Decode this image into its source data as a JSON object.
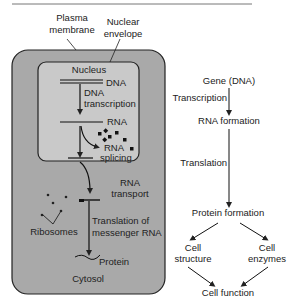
{
  "colors": {
    "cytosol_fill": "#a9a9a9",
    "nucleus_fill": "#c9c9c9",
    "outline": "#222222",
    "text": "#222222",
    "background": "#ffffff"
  },
  "left_panel": {
    "labels": {
      "plasma_membrane_1": "Plasma",
      "plasma_membrane_2": "membrane",
      "nuclear_envelope_1": "Nuclear",
      "nuclear_envelope_2": "envelope",
      "nucleus": "Nucleus",
      "dna": "DNA",
      "dna_transcription_1": "DNA",
      "dna_transcription_2": "transcription",
      "rna": "RNA",
      "rna_splicing_1": "RNA",
      "rna_splicing_2": "splicing",
      "rna_transport_1": "RNA",
      "rna_transport_2": "transport",
      "ribosomes": "Ribosomes",
      "translation_1": "Translation of",
      "translation_2": "messenger RNA",
      "protein": "Protein",
      "cytosol": "Cytosol"
    }
  },
  "right_panel": {
    "nodes": {
      "gene": "Gene (DNA)",
      "rna_formation": "RNA formation",
      "protein_formation": "Protein formation",
      "cell_structure_1": "Cell",
      "cell_structure_2": "structure",
      "cell_enzymes_1": "Cell",
      "cell_enzymes_2": "enzymes",
      "cell_function": "Cell function"
    },
    "edges": {
      "transcription": "Transcription",
      "translation": "Translation"
    }
  }
}
